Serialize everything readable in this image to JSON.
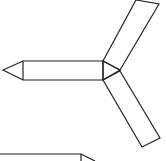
{
  "diagram": {
    "stroke_color": "#222222",
    "background": "#ffffff",
    "shapes": {
      "left_arm": {
        "points": "3,70 23,61 103,61 103,80 23,80"
      },
      "left_arm_divider": {
        "x1": 23,
        "y1": 61,
        "x2": 23,
        "y2": 80
      },
      "hub": {
        "points": "103,61 120,70 103,80"
      },
      "upper_arm": {
        "points": "103,61 136,0 159,4 120,70"
      },
      "lower_arm": {
        "points": "103,80 120,71 160,138 142,147"
      },
      "bottom_partial": {
        "points": "0,154 81,154 95,161"
      },
      "bottom_partial_vertical": {
        "x1": 81,
        "y1": 154,
        "x2": 81,
        "y2": 161
      }
    }
  }
}
